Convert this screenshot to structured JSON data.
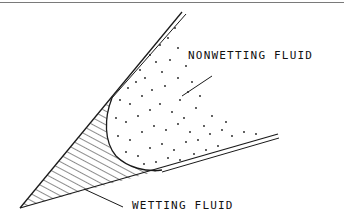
{
  "figure": {
    "type": "wedge capillary diagram",
    "labels": {
      "nonwetting": "NONWETTING FLUID",
      "wetting": "WETTING FLUID"
    },
    "colors": {
      "line": "#1a1a1a",
      "background": "#ffffff",
      "frame_line": "#7a7a7a"
    }
  }
}
